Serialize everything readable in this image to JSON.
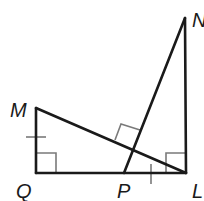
{
  "diagram": {
    "type": "geometry",
    "colors": {
      "line": "#1a1a1a",
      "mark": "#7a7a7a"
    },
    "points": {
      "M": {
        "label": "M",
        "x": 36,
        "y": 108
      },
      "Q": {
        "label": "Q",
        "x": 36,
        "y": 173
      },
      "P": {
        "label": "P",
        "x": 124,
        "y": 173
      },
      "L": {
        "label": "L",
        "x": 186,
        "y": 173
      },
      "N": {
        "label": "N",
        "x": 185,
        "y": 18
      }
    },
    "segments": [
      "MQ",
      "QL",
      "ML",
      "NL",
      "NP"
    ],
    "right_angles": [
      "MQL",
      "NLQ",
      "NP ⊥ ML"
    ],
    "congruence_ticks": [
      "MQ",
      "PL"
    ]
  }
}
